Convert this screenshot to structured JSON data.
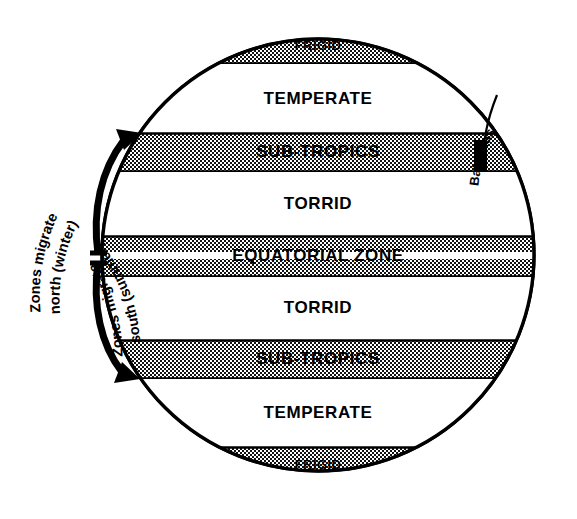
{
  "figure": {
    "globe": {
      "center_x": 318,
      "center_y": 255,
      "radius": 217,
      "outline_color": "#000000",
      "fill_color": "#ffffff"
    },
    "bands": [
      {
        "id": "frigid-north",
        "label": "FRIGID",
        "shaded": true,
        "y_top": 30,
        "y_bottom": 64,
        "label_size": "small",
        "pattern": "checker-dense"
      },
      {
        "id": "temperate-north",
        "label": "TEMPERATE",
        "shaded": false,
        "y_top": 64,
        "y_bottom": 133,
        "label_size": "big",
        "pattern": "none"
      },
      {
        "id": "subtropics-north",
        "label": "SUB-TROPICS",
        "shaded": true,
        "y_top": 133,
        "y_bottom": 172,
        "label_size": "big",
        "pattern": "checker-dense"
      },
      {
        "id": "torrid-north",
        "label": "TORRID",
        "shaded": false,
        "y_top": 172,
        "y_bottom": 236,
        "label_size": "big",
        "pattern": "none"
      },
      {
        "id": "equatorial-zone",
        "label": "EQUATORIAL ZONE",
        "shaded": true,
        "y_top": 236,
        "y_bottom": 277,
        "label_size": "big",
        "pattern": "checker-dense-split"
      },
      {
        "id": "torrid-south",
        "label": "TORRID",
        "shaded": false,
        "y_top": 277,
        "y_bottom": 340,
        "label_size": "big",
        "pattern": "none"
      },
      {
        "id": "subtropics-south",
        "label": "SUB-TROPICS",
        "shaded": true,
        "y_top": 340,
        "y_bottom": 379,
        "label_size": "big",
        "pattern": "checker-dense"
      },
      {
        "id": "temperate-south",
        "label": "TEMPERATE",
        "shaded": false,
        "y_top": 379,
        "y_bottom": 447,
        "label_size": "big",
        "pattern": "none"
      },
      {
        "id": "frigid-south",
        "label": "FRIGID",
        "shaded": true,
        "y_top": 447,
        "y_bottom": 480,
        "label_size": "small",
        "pattern": "checker-dense"
      }
    ],
    "annotations": {
      "migration_north": {
        "line1": "Zones migrate",
        "line2": "north (winter)",
        "arrow_direction": "up",
        "arrow_color": "#000000"
      },
      "migration_south": {
        "line1": "Zones migrate",
        "line2": "south (summer)",
        "arrow_direction": "down",
        "arrow_color": "#000000"
      },
      "location_marker": {
        "label": "Bahamas",
        "marker_color": "#000000",
        "on_band": "subtropics-north"
      }
    }
  }
}
